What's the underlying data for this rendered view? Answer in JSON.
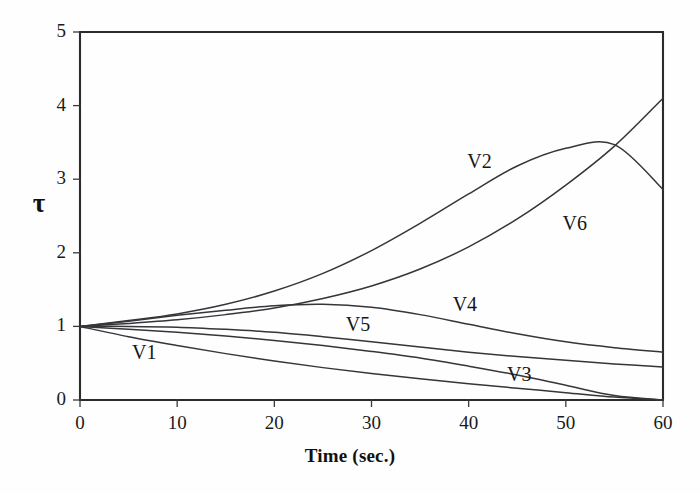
{
  "figure": {
    "background": "#fefefe",
    "ink_color": "#35353a"
  },
  "chart_data": {
    "type": "line",
    "title": "",
    "xlabel": "Time (sec.)",
    "ylabel": "τ",
    "xlim": [
      0,
      60
    ],
    "ylim": [
      0,
      5
    ],
    "xticks": [
      0,
      10,
      20,
      30,
      40,
      50,
      60
    ],
    "xtick_labels": [
      "0",
      "10",
      "20",
      "30",
      "40",
      "50",
      "60"
    ],
    "yticks": [
      0,
      1,
      2,
      3,
      4,
      5
    ],
    "ytick_labels": [
      "0",
      "1",
      "2",
      "3",
      "4",
      "5"
    ],
    "grid": false,
    "legend": "inline-curve-labels",
    "x": [
      0,
      5,
      10,
      15,
      20,
      25,
      30,
      35,
      40,
      45,
      50,
      55,
      60
    ],
    "series": [
      {
        "name": "V1",
        "label": "V1",
        "label_x": 7.0,
        "label_y": 0.63,
        "values": [
          1.0,
          0.86,
          0.74,
          0.63,
          0.53,
          0.44,
          0.36,
          0.29,
          0.22,
          0.16,
          0.1,
          0.04,
          0.0
        ]
      },
      {
        "name": "V2",
        "label": "V2",
        "label_x": 41.5,
        "label_y": 3.22,
        "values": [
          1.0,
          1.08,
          1.17,
          1.3,
          1.48,
          1.72,
          2.03,
          2.4,
          2.8,
          3.18,
          3.42,
          3.47,
          2.86
        ]
      },
      {
        "name": "V3",
        "label": "V3",
        "label_x": 45.6,
        "label_y": 0.33,
        "values": [
          1.0,
          0.96,
          0.92,
          0.87,
          0.81,
          0.74,
          0.66,
          0.57,
          0.46,
          0.34,
          0.2,
          0.06,
          0.0
        ]
      },
      {
        "name": "V4",
        "label": "V4",
        "label_x": 40.0,
        "label_y": 1.28,
        "values": [
          1.0,
          1.07,
          1.15,
          1.22,
          1.28,
          1.3,
          1.26,
          1.16,
          1.03,
          0.9,
          0.79,
          0.71,
          0.65
        ]
      },
      {
        "name": "V5",
        "label": "V5",
        "label_x": 29.0,
        "label_y": 1.0,
        "values": [
          1.0,
          1.0,
          0.99,
          0.96,
          0.92,
          0.86,
          0.79,
          0.72,
          0.65,
          0.59,
          0.54,
          0.49,
          0.45
        ]
      },
      {
        "name": "V6",
        "label": "V6",
        "label_x": 51.3,
        "label_y": 2.38,
        "values": [
          1.0,
          1.04,
          1.09,
          1.16,
          1.25,
          1.38,
          1.55,
          1.78,
          2.08,
          2.46,
          2.92,
          3.45,
          4.1
        ]
      }
    ]
  }
}
